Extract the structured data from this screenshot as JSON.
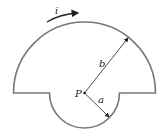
{
  "diagram": {
    "title": "",
    "labels": {
      "current": "i",
      "point": "P",
      "outer_radius": "b",
      "inner_radius": "a"
    },
    "colors": {
      "outline": "#777777",
      "text": "#222222",
      "arrow": "#222222"
    },
    "geometry": {
      "center": [
        84.5,
        93
      ],
      "outer_radius_px": 71,
      "inner_radius_px": 35
    }
  }
}
